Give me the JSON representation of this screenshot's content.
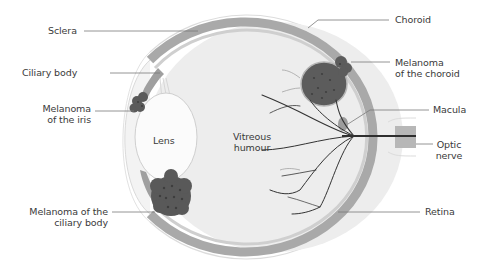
{
  "diagram": {
    "type": "anatomical-cross-section",
    "colors": {
      "background": "#ffffff",
      "sclera_outline": "#d8d8d8",
      "choroid_band": "#a9a9a9",
      "retina_inner": "#c4c4c4",
      "vitreous": "#ededed",
      "lens": "#fbfbfb",
      "melanoma": "#5a5a5a",
      "melanoma_spots": "#3e3e3e",
      "vessels": "#333333",
      "leader_lines": "#7a7a7a",
      "text": "#3a3a3a"
    },
    "labels_left": [
      {
        "id": "sclera",
        "text": "Sclera"
      },
      {
        "id": "ciliary-body",
        "text": "Ciliary body"
      },
      {
        "id": "melanoma-iris",
        "line1": "Melanoma",
        "line2": "of the iris"
      },
      {
        "id": "melanoma-ciliary",
        "line1": "Melanoma of the",
        "line2": "ciliary body"
      }
    ],
    "labels_right": [
      {
        "id": "choroid",
        "text": "Choroid"
      },
      {
        "id": "melanoma-choroid",
        "line1": "Melanoma",
        "line2": "of the choroid"
      },
      {
        "id": "macula",
        "text": "Macula"
      },
      {
        "id": "optic-nerve",
        "line1": "Optic",
        "line2": "nerve"
      },
      {
        "id": "retina",
        "text": "Retina"
      }
    ],
    "labels_inner": [
      {
        "id": "lens",
        "text": "Lens"
      },
      {
        "id": "vitreous",
        "line1": "Vitreous",
        "line2": "humour"
      }
    ]
  }
}
